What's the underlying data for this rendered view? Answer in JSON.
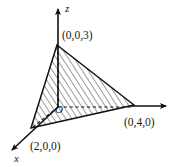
{
  "figure": {
    "background_color": "#ffffff",
    "ink_color": "#111111",
    "axes": [
      {
        "name": "x",
        "label": "x",
        "direction": "down-left",
        "style": "solid",
        "arrow": true
      },
      {
        "name": "y",
        "label": "y",
        "direction": "right",
        "style": "solid-and-dashed",
        "arrow": true
      },
      {
        "name": "z",
        "label": "z",
        "direction": "up",
        "style": "solid",
        "arrow": true
      }
    ],
    "origin": {
      "label": "O"
    },
    "vertices": [
      {
        "name": "z-intercept",
        "label": "(0,0,3)",
        "coords": [
          0,
          0,
          3
        ]
      },
      {
        "name": "y-intercept",
        "label": "(0,4,0)",
        "coords": [
          0,
          4,
          0
        ]
      },
      {
        "name": "x-intercept",
        "label": "(2,0,0)",
        "coords": [
          2,
          0,
          0
        ]
      }
    ],
    "region": {
      "name": "triangle",
      "fill": "hatched",
      "hatch_angle_deg": 33,
      "hatch_spacing_px": 5
    }
  }
}
